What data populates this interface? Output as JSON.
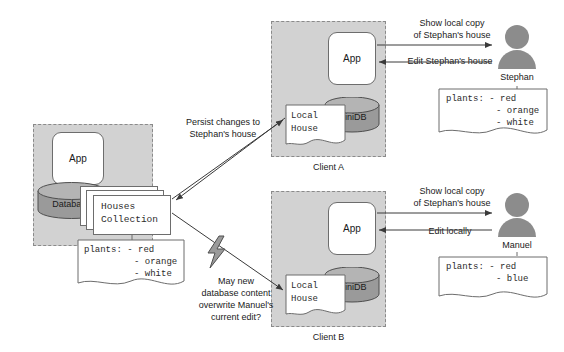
{
  "diagram": {
    "colors": {
      "zone_fill": "#d2d2d2",
      "zone_border": "#8a8a8a",
      "cylinder_fill": "#9a9a9a",
      "cylinder_top": "#b4b4b4",
      "box_fill": "#ffffff",
      "stroke": "#6d6d6d",
      "person_fill": "#8c8c8c",
      "bolt_fill": "#9a9a9a",
      "text": "#1a1a1a"
    }
  },
  "server": {
    "label": "Server",
    "app_label": "App",
    "database_label": "Database",
    "collection_line1": "Houses",
    "collection_line2": "Collection",
    "note": {
      "line1": "plants: - red",
      "line2": "- orange",
      "line3": "- white"
    }
  },
  "client_a": {
    "label": "Client A",
    "app_label": "App",
    "minidb_label": "MiniDB",
    "local_house_line1": "Local",
    "local_house_line2": "House"
  },
  "client_b": {
    "label": "Client B",
    "app_label": "App",
    "minidb_label": "MiniDB",
    "local_house_line1": "Local",
    "local_house_line2": "House"
  },
  "stephan": {
    "name": "Stephan",
    "show_label": "Show local copy\nof Stephan's house",
    "edit_label": "Edit Stephan's house",
    "note": {
      "line1": "plants: - red",
      "line2": "- orange",
      "line3": "- white"
    }
  },
  "manuel": {
    "name": "Manuel",
    "show_label": "Show local copy\nof Stephan's house",
    "edit_label": "Edit locally",
    "note": {
      "line1": "plants: - red",
      "line2": "- blue"
    }
  },
  "annotations": {
    "persist": "Persist changes to\nStephan's house",
    "conflict": "May new\ndatabase content\noverwrite Manuel's\ncurrent edit?"
  }
}
